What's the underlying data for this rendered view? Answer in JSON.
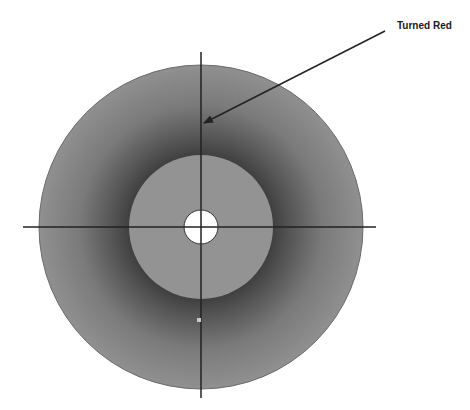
{
  "diagram": {
    "annotation": "Turned Red",
    "colors": {
      "background": "#ffffff",
      "outer_disc_edge": "#8e8e8e",
      "outer_disc_dark_ring": "#4a4a4a",
      "inner_disc": "#939393",
      "center_hole": "#ffffff",
      "lines": "#222222",
      "marker_dot": "#c8c8c8"
    },
    "geometry": {
      "center": [
        201,
        227
      ],
      "outer_radius": 162,
      "inner_radius": 72,
      "hole_radius": 17,
      "arrow_start": [
        385,
        31
      ],
      "arrow_tip": [
        203,
        124
      ],
      "marker_dot": [
        199,
        320
      ]
    }
  }
}
